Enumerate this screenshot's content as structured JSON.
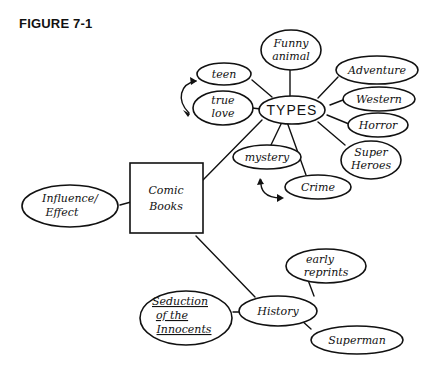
{
  "figure": {
    "label": "FIGURE 7-1"
  },
  "central": {
    "label_line1": "Comic",
    "label_line2": "Books"
  },
  "branches": {
    "types": {
      "label": "TYPES",
      "children": {
        "funny_animal": {
          "line1": "Funny",
          "line2": "animal"
        },
        "adventure": {
          "line1": "Adventure"
        },
        "western": {
          "line1": "Western"
        },
        "horror": {
          "line1": "Horror"
        },
        "super_heroes": {
          "line1": "Super",
          "line2": "Heroes"
        },
        "crime": {
          "line1": "Crime"
        },
        "mystery": {
          "line1": "mystery"
        },
        "true_love": {
          "line1": "true",
          "line2": "love"
        },
        "teen": {
          "line1": "teen"
        }
      }
    },
    "influence": {
      "line1": "Influence/",
      "line2": "Effect"
    },
    "history": {
      "label": "History",
      "children": {
        "early_reprints": {
          "line1": "early",
          "line2": "reprints"
        },
        "superman": {
          "line1": "Superman"
        },
        "seduction": {
          "line1": "Seduction",
          "line2": "of the",
          "line3": "Innocents"
        }
      }
    }
  }
}
